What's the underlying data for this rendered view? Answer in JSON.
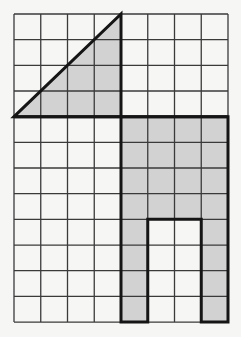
{
  "diagram": {
    "type": "grid-figure",
    "grid": {
      "columns": 8,
      "rows": 12,
      "origin_x": 14,
      "origin_y": 14,
      "cell_width": 26.75,
      "cell_height": 25.67,
      "line_color": "#3a3a3a",
      "background": "#f6f6f5"
    },
    "colors": {
      "shade": "#d2d2d2",
      "outline": "#151515"
    },
    "shapes": [
      {
        "name": "triangle",
        "description": "Right triangle with legs of 4 units (horizontal) and 4 units (vertical)",
        "vertices_grid": [
          [
            0,
            4
          ],
          [
            4,
            0
          ],
          [
            4,
            4
          ]
        ],
        "shaded": true
      },
      {
        "name": "arch-shape",
        "description": "4x8 rectangle with a 2x4 rectangular opening at the bottom center",
        "vertices_grid": [
          [
            4,
            4
          ],
          [
            8,
            4
          ],
          [
            8,
            12
          ],
          [
            7,
            12
          ],
          [
            7,
            8
          ],
          [
            5,
            8
          ],
          [
            5,
            12
          ],
          [
            4,
            12
          ]
        ],
        "shaded": true
      }
    ],
    "separator_line": {
      "from_grid": [
        0,
        4
      ],
      "to_grid": [
        8,
        4
      ]
    }
  }
}
